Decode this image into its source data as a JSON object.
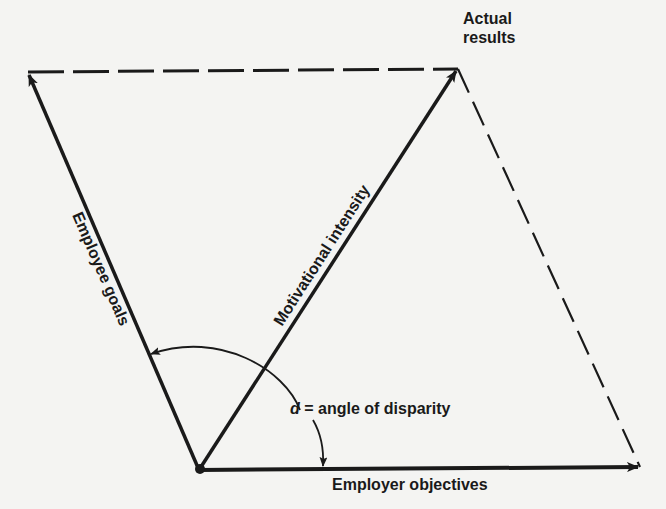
{
  "diagram": {
    "labels": {
      "actual_results_line1": "Actual",
      "actual_results_line2": "results",
      "employee_goals": "Employee goals",
      "motivational_intensity": "Motivational intensity",
      "employer_objectives": "Employer objectives",
      "angle_symbol": "d",
      "angle_definition": " = angle of disparity"
    },
    "vectors": [
      {
        "id": "employee-goals",
        "label": "Employee goals",
        "style": "solid",
        "arrow": true
      },
      {
        "id": "motivational-intensity",
        "label": "Motivational intensity",
        "style": "solid",
        "arrow": true
      },
      {
        "id": "employer-objectives",
        "label": "Employer objectives",
        "style": "solid",
        "arrow": true
      }
    ],
    "construction_lines": [
      {
        "id": "goals-to-results",
        "style": "dashed"
      },
      {
        "id": "results-to-objectives",
        "style": "dashed"
      }
    ],
    "colors": {
      "ink": "#1a1a1a",
      "paper": "#f4f4f2"
    }
  }
}
